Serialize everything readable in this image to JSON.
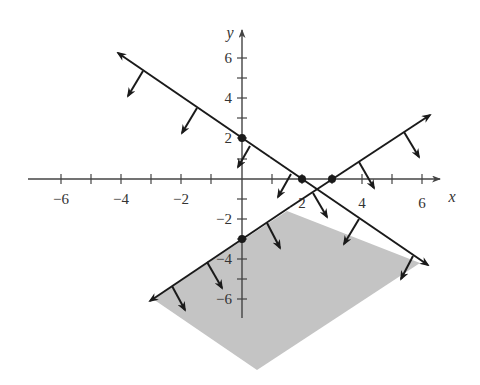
{
  "figure": {
    "type": "linear-inequalities-feasible-region",
    "x_axis_label": "x",
    "y_axis_label": "y",
    "x_ticks": [
      {
        "value": -6,
        "label": "−6"
      },
      {
        "value": -4,
        "label": "−4"
      },
      {
        "value": -2,
        "label": "−2"
      },
      {
        "value": 2,
        "label": "2"
      },
      {
        "value": 4,
        "label": "4"
      },
      {
        "value": 6,
        "label": "6"
      }
    ],
    "y_ticks": [
      {
        "value": 6,
        "label": "6"
      },
      {
        "value": 4,
        "label": "4"
      },
      {
        "value": 2,
        "label": "2"
      },
      {
        "value": -2,
        "label": "−2"
      },
      {
        "value": -4,
        "label": "−4"
      },
      {
        "value": -6,
        "label": "−6"
      }
    ],
    "lines": [
      {
        "name": "line-x-plus-y-eq-2",
        "equation": "x + y = 2",
        "inequality": "x + y ≤ 2",
        "intercepts": [
          [
            0,
            2
          ],
          [
            2,
            0
          ]
        ]
      },
      {
        "name": "line-x-minus-y-eq-3",
        "equation": "x − y = 3",
        "inequality": "x − y ≤ 3",
        "intercepts": [
          [
            0,
            -3
          ],
          [
            3,
            0
          ]
        ]
      }
    ],
    "shaded_region": "x + y ≤ 2 and x − y ≥ 3",
    "colors": {
      "shade": "#c4c4c4",
      "line": "#1a1a1a",
      "axis": "#444444"
    }
  }
}
